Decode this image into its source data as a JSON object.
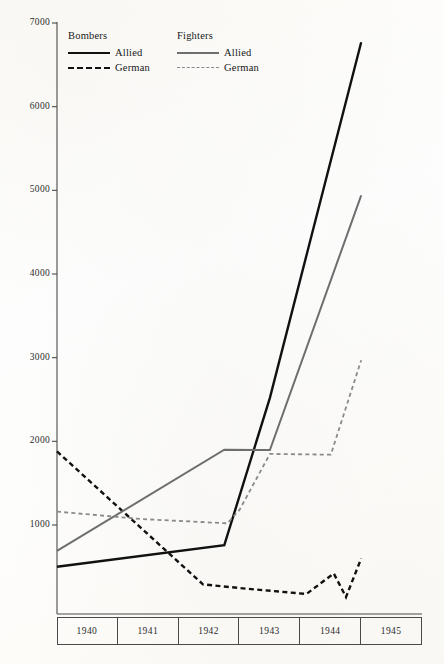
{
  "figure": {
    "background_color": "#fdfdfb",
    "ink_color": "#111111",
    "grey_color": "#6e6e6e",
    "light_grey_color": "#8a8a8a",
    "axis_color": "#4a4a4a"
  },
  "legend": {
    "groups": [
      {
        "title": "Bombers",
        "entries": [
          {
            "label": "Allied",
            "style": "solid",
            "color": "#111111"
          },
          {
            "label": "German",
            "style": "dashed",
            "color": "#111111"
          }
        ]
      },
      {
        "title": "Fighters",
        "entries": [
          {
            "label": "Allied",
            "style": "solid",
            "color": "#6e6e6e"
          },
          {
            "label": "German",
            "style": "dashed",
            "color": "#8a8a8a"
          }
        ]
      }
    ]
  },
  "axes": {
    "y_ticks": [
      "7000",
      "6000",
      "5000",
      "4000",
      "3000",
      "2000",
      "1000"
    ],
    "x_cells": [
      "1940",
      "1941",
      "1942",
      "1943",
      "1944",
      "1945"
    ]
  },
  "bleed_caption": "",
  "chart_data": {
    "type": "line",
    "title": "",
    "subtitle": "",
    "xlabel": "",
    "ylabel": "",
    "xlim": [
      1940.0,
      1945.5
    ],
    "ylim": [
      0,
      7000
    ],
    "ytick_values": [
      1000,
      2000,
      3000,
      4000,
      5000,
      6000,
      7000
    ],
    "xtick_values": [
      1940,
      1941,
      1942,
      1943,
      1944,
      1945
    ],
    "grid": false,
    "legend_position": "top-left",
    "x": [
      1940.0,
      1940.5,
      1941.5,
      1942.5,
      1943.0,
      1943.5,
      1944.0,
      1944.5,
      1945.0
    ],
    "series": [
      {
        "name": "Bombers — Allied",
        "group": "Bombers",
        "side": "Allied",
        "style": "solid",
        "color": "#111111",
        "width": 2.4,
        "points": [
          {
            "x": 1940.0,
            "y": 500
          },
          {
            "x": 1942.75,
            "y": 760
          },
          {
            "x": 1943.5,
            "y": 2520
          },
          {
            "x": 1945.0,
            "y": 6770
          }
        ]
      },
      {
        "name": "Bombers — German",
        "group": "Bombers",
        "side": "German",
        "style": "dashed",
        "color": "#111111",
        "width": 2.4,
        "points": [
          {
            "x": 1940.0,
            "y": 1880
          },
          {
            "x": 1942.4,
            "y": 290
          },
          {
            "x": 1943.1,
            "y": 240
          },
          {
            "x": 1944.1,
            "y": 175
          },
          {
            "x": 1944.55,
            "y": 420
          },
          {
            "x": 1944.75,
            "y": 140
          },
          {
            "x": 1945.0,
            "y": 600
          }
        ]
      },
      {
        "name": "Fighters — Allied",
        "group": "Fighters",
        "side": "Allied",
        "style": "solid",
        "color": "#6e6e6e",
        "width": 2.0,
        "points": [
          {
            "x": 1940.0,
            "y": 690
          },
          {
            "x": 1942.75,
            "y": 1900
          },
          {
            "x": 1943.5,
            "y": 1895
          },
          {
            "x": 1945.0,
            "y": 4940
          }
        ]
      },
      {
        "name": "Fighters — German",
        "group": "Fighters",
        "side": "German",
        "style": "dashed",
        "color": "#8a8a8a",
        "width": 1.8,
        "points": [
          {
            "x": 1940.0,
            "y": 1160
          },
          {
            "x": 1941.4,
            "y": 1070
          },
          {
            "x": 1942.8,
            "y": 1020
          },
          {
            "x": 1943.0,
            "y": 1180
          },
          {
            "x": 1943.5,
            "y": 1850
          },
          {
            "x": 1944.5,
            "y": 1840
          },
          {
            "x": 1945.0,
            "y": 2970
          }
        ]
      }
    ]
  }
}
